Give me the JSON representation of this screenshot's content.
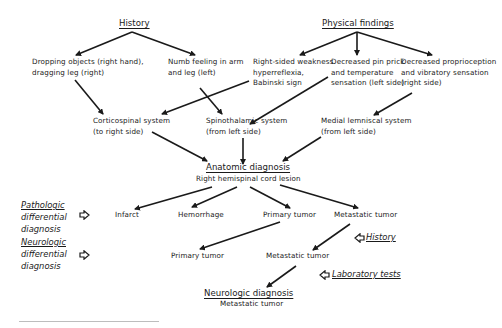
{
  "top": {
    "history": "History",
    "physical_findings": "Physical findings"
  },
  "history_items": [
    {
      "line1": "Dropping objects (right hand),",
      "line2": "dragging leg (right)"
    },
    {
      "line1": "Numb feeling in arm",
      "line2": "and leg (left)"
    }
  ],
  "physical_items": [
    {
      "line1": "Right-sided weakness",
      "line2": "hyperreflexia,",
      "line3": "Babinski sign"
    },
    {
      "line1": "Decreased pin prick",
      "line2": "and temperature",
      "line3": "sensation (left side)"
    },
    {
      "line1": "Decreased proprioception",
      "line2": "and vibratory sensation",
      "line3": "(right side)"
    }
  ],
  "systems": [
    {
      "line1": "Corticospinal system",
      "line2": "(to right side)"
    },
    {
      "line1": "Spinothalamic system",
      "line2": "(from left side)"
    },
    {
      "line1": "Medial lemniscal system",
      "line2": "(from left side)"
    }
  ],
  "anatomic": {
    "title": "Anatomic diagnosis",
    "value": "Right hemispinal cord lesion"
  },
  "pathologic": {
    "label_line1": "Pathologic",
    "label_line2": "differential",
    "label_line3": "diagnosis",
    "items": [
      "Infarct",
      "Hemorrhage",
      "Primary tumor",
      "Metastatic tumor"
    ]
  },
  "neurologic_diff": {
    "label_line1": "Neurologic",
    "label_line2": "differential",
    "label_line3": "diagnosis",
    "items": [
      "Primary tumor",
      "Metastatic tumor"
    ]
  },
  "inputs": {
    "history": "History",
    "laboratory_tests": "Laboratory tests"
  },
  "neurologic_diagnosis": {
    "title": "Neurologic diagnosis",
    "value": "Metastatic tumor"
  },
  "colors": {
    "ink": "#1a1a1a",
    "background": "#ffffff",
    "rule": "#bdbdbd"
  }
}
